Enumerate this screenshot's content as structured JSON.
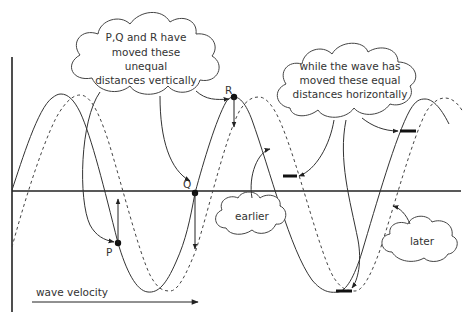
{
  "diagram": {
    "title": "",
    "colors": {
      "line": "#333333",
      "background": "#ffffff"
    },
    "points": {
      "P": {
        "label": "P"
      },
      "Q": {
        "label": "Q"
      },
      "R": {
        "label": "R"
      }
    },
    "clouds": {
      "vertical": {
        "lines": [
          "P,Q and R have",
          "moved these",
          "unequal",
          "distances vertically"
        ]
      },
      "horizontal": {
        "lines": [
          "while the wave has",
          "moved these equal",
          "distances horizontally"
        ]
      },
      "earlier": {
        "label": "earlier"
      },
      "later": {
        "label": "later"
      }
    },
    "velocity_label": "wave velocity",
    "legend": {
      "solid_curve": "earlier",
      "dashed_curve": "later"
    }
  }
}
